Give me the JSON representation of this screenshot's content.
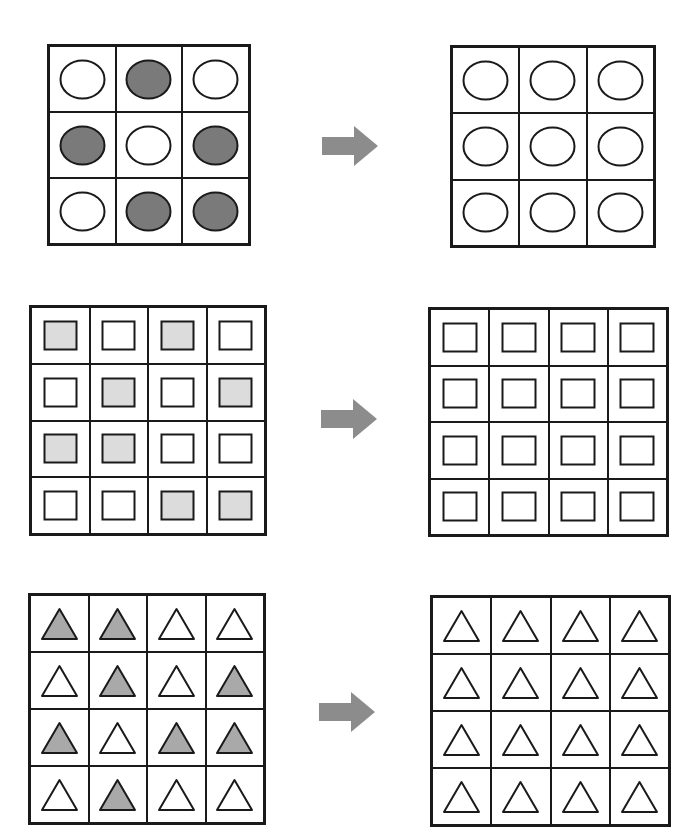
{
  "colors": {
    "stroke": "#1a1a1a",
    "circle_fill": "#7a7a7a",
    "square_fill": "#dcdcdc",
    "triangle_fill": "#a9a9a9",
    "empty_fill": "#ffffff",
    "arrow": "#8c8c8c"
  },
  "rows": [
    {
      "shape": "circle",
      "size": 3,
      "before": [
        [
          0,
          1,
          0
        ],
        [
          1,
          0,
          1
        ],
        [
          0,
          1,
          1
        ]
      ],
      "after": [
        [
          0,
          0,
          0
        ],
        [
          0,
          0,
          0
        ],
        [
          0,
          0,
          0
        ]
      ],
      "left": {
        "x": 47,
        "y": 44,
        "w": 204,
        "h": 202
      },
      "right": {
        "x": 450,
        "y": 45,
        "w": 206,
        "h": 203
      },
      "arrow": {
        "x": 320,
        "y": 124
      }
    },
    {
      "shape": "square",
      "size": 4,
      "before": [
        [
          1,
          0,
          1,
          0
        ],
        [
          0,
          1,
          0,
          1
        ],
        [
          1,
          1,
          0,
          0
        ],
        [
          0,
          0,
          1,
          1
        ]
      ],
      "after": [
        [
          0,
          0,
          0,
          0
        ],
        [
          0,
          0,
          0,
          0
        ],
        [
          0,
          0,
          0,
          0
        ],
        [
          0,
          0,
          0,
          0
        ]
      ],
      "left": {
        "x": 29,
        "y": 305,
        "w": 238,
        "h": 231
      },
      "right": {
        "x": 428,
        "y": 307,
        "w": 241,
        "h": 230
      },
      "arrow": {
        "x": 319,
        "y": 397
      }
    },
    {
      "shape": "triangle",
      "size": 4,
      "before": [
        [
          1,
          1,
          0,
          0
        ],
        [
          0,
          1,
          0,
          1
        ],
        [
          1,
          0,
          1,
          1
        ],
        [
          0,
          1,
          0,
          0
        ]
      ],
      "after": [
        [
          0,
          0,
          0,
          0
        ],
        [
          0,
          0,
          0,
          0
        ],
        [
          0,
          0,
          0,
          0
        ],
        [
          0,
          0,
          0,
          0
        ]
      ],
      "left": {
        "x": 28,
        "y": 593,
        "w": 238,
        "h": 232
      },
      "right": {
        "x": 430,
        "y": 595,
        "w": 241,
        "h": 232
      },
      "arrow": {
        "x": 317,
        "y": 690
      }
    }
  ]
}
